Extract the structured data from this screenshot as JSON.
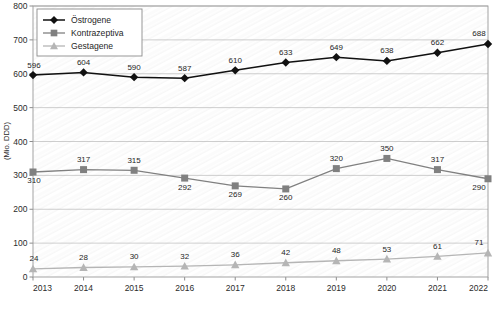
{
  "chart_data": {
    "type": "line",
    "title": "",
    "xlabel": "",
    "ylabel": "(Mio. DDD)",
    "categories": [
      "2013",
      "2014",
      "2015",
      "2016",
      "2017",
      "2018",
      "2019",
      "2020",
      "2021",
      "2022"
    ],
    "ylim": [
      0,
      800
    ],
    "ytick_step": 100,
    "yticks": [
      "0",
      "100",
      "200",
      "300",
      "400",
      "500",
      "600",
      "700",
      "800"
    ],
    "grid": true,
    "legend_position": "top-left",
    "series": [
      {
        "name": "Östrogene",
        "marker": "diamond",
        "color": "#111111",
        "values": [
          596,
          604,
          590,
          587,
          610,
          633,
          649,
          638,
          662,
          688
        ],
        "labels": [
          "596",
          "604",
          "590",
          "587",
          "610",
          "633",
          "649",
          "638",
          "662",
          "688"
        ]
      },
      {
        "name": "Kontrazeptiva",
        "marker": "square",
        "color": "#808080",
        "values": [
          310,
          317,
          315,
          292,
          269,
          260,
          320,
          350,
          317,
          290
        ],
        "labels": [
          "310",
          "317",
          "315",
          "292",
          "269",
          "260",
          "320",
          "350",
          "317",
          "290"
        ]
      },
      {
        "name": "Gestagene",
        "marker": "triangle",
        "color": "#b5b5b5",
        "values": [
          24,
          28,
          30,
          32,
          36,
          42,
          48,
          53,
          61,
          71
        ],
        "labels": [
          "24",
          "28",
          "30",
          "32",
          "36",
          "42",
          "48",
          "53",
          "61",
          "71"
        ]
      }
    ]
  },
  "legend": {
    "entries": [
      "Östrogene",
      "Kontrazeptiva",
      "Gestagene"
    ]
  },
  "colors": {
    "estrogen": "#111111",
    "contraceptive": "#808080",
    "gestagen": "#b5b5b5",
    "grid": "#b9b9b9",
    "frame": "#9a9a9a"
  }
}
